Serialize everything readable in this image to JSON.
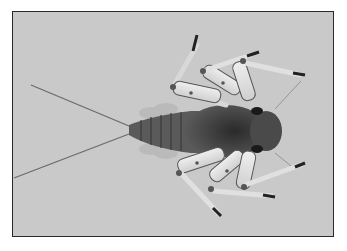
{
  "image": {
    "subject": "mayfly nymph (dorsal view)",
    "background_color": "#c9c9c9",
    "border_color": "#2a2a2a",
    "body_color": "#3a3a3a",
    "leg_color": "#e4e4e4",
    "description": "Photograph of an aquatic insect nymph with six banded legs, dark segmented abdomen with lateral gills, and two long tail filaments extending to the left"
  }
}
